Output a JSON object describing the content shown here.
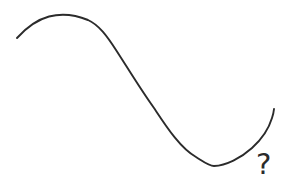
{
  "canvas": {
    "width": 291,
    "height": 188,
    "background_color": "#ffffff",
    "stroke_color": "#2b2b2b",
    "stroke_width": 1.9,
    "description": "Hand-drawn S-shaped curve with a question mark near its right end"
  },
  "annotations": {
    "question_mark": "?"
  },
  "chart_data": {
    "type": "line",
    "title": "",
    "subtitle": "",
    "xlabel": "",
    "ylabel": "",
    "grid": false,
    "legend": null,
    "axis_visible": false,
    "xlim": [
      0,
      291
    ],
    "ylim": [
      188,
      0
    ],
    "series": [
      {
        "name": "hand-drawn-s-curve",
        "color": "#2b2b2b",
        "smooth": true,
        "points": [
          [
            17,
            38
          ],
          [
            24,
            31
          ],
          [
            31,
            26
          ],
          [
            39,
            21
          ],
          [
            48,
            17
          ],
          [
            58,
            15
          ],
          [
            68,
            14
          ],
          [
            78,
            15
          ],
          [
            87,
            18
          ],
          [
            95,
            23
          ],
          [
            103,
            31
          ],
          [
            111,
            41
          ],
          [
            119,
            53
          ],
          [
            127,
            66
          ],
          [
            135,
            79
          ],
          [
            143,
            92
          ],
          [
            151,
            104
          ],
          [
            160,
            116
          ],
          [
            169,
            128
          ],
          [
            178,
            139
          ],
          [
            187,
            149
          ],
          [
            196,
            157
          ],
          [
            205,
            163
          ],
          [
            213,
            166
          ],
          [
            221,
            165
          ],
          [
            230,
            162
          ],
          [
            239,
            157
          ],
          [
            248,
            151
          ],
          [
            256,
            144
          ],
          [
            262,
            136
          ],
          [
            267,
            128
          ],
          [
            270,
            120
          ],
          [
            272,
            114
          ],
          [
            274,
            109
          ]
        ],
        "path_d": "M 17,38 C 26,28 36,20 49,16.5 C 62,13.2 77,15.5 88,20 C 99,25 107,36 116,50 C 129,70 141,90 154,108 C 166,126 180,148 196,157 C 204,162 209,166 214,166 C 226,165.5 241,158 252,148 C 262,139 269,128 272,118 C 273.4,114 273.8,111 274,109"
      }
    ],
    "annotations": [
      {
        "text": "?",
        "x": 264,
        "y": 168,
        "color": "#2b2b2b",
        "font_size": 29
      }
    ]
  }
}
